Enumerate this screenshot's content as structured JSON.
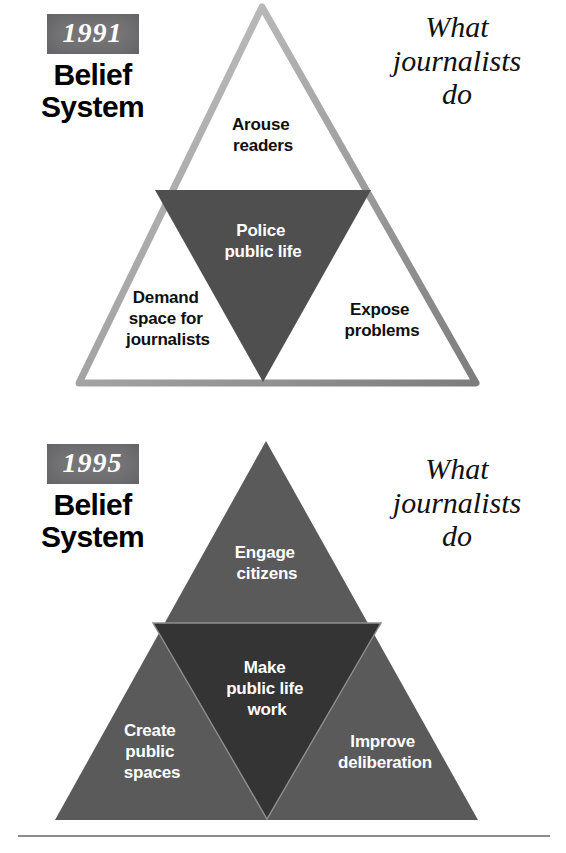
{
  "panels": [
    {
      "id": "1991",
      "year": "1991",
      "title_line1": "Belief",
      "title_line2": "System",
      "caption_line1": "What",
      "caption_line2": "journalists",
      "caption_line3": "do",
      "outer_fill": "#ffffff",
      "outer_stroke": "#9a9a9a",
      "inner_fill": "#4f4f4f",
      "outer_text_color": "#101010",
      "inner_text_color": "#ffffff",
      "zones": {
        "top": {
          "lines": [
            "Arouse",
            "readers"
          ]
        },
        "left": {
          "lines": [
            "Demand",
            "space for",
            "journalists"
          ]
        },
        "right": {
          "lines": [
            "Expose",
            "problems"
          ]
        },
        "center": {
          "lines": [
            "Police",
            "public life"
          ]
        }
      }
    },
    {
      "id": "1995",
      "year": "1995",
      "title_line1": "Belief",
      "title_line2": "System",
      "caption_line1": "What",
      "caption_line2": "journalists",
      "caption_line3": "do",
      "outer_fill": "#5a5a5a",
      "outer_stroke": "#8f8f8f",
      "inner_fill": "#343434",
      "outer_text_color": "#ffffff",
      "inner_text_color": "#ffffff",
      "zones": {
        "top": {
          "lines": [
            "Engage",
            "citizens"
          ]
        },
        "left": {
          "lines": [
            "Create",
            "public",
            "spaces"
          ]
        },
        "right": {
          "lines": [
            "Improve",
            "deliberation"
          ]
        },
        "center": {
          "lines": [
            "Make",
            "public life",
            "work"
          ]
        }
      }
    }
  ],
  "badge_color": "#77777a",
  "footer_rule_color": "#8c8c8c"
}
